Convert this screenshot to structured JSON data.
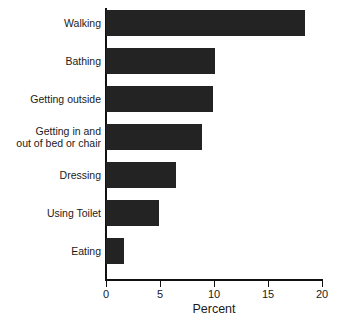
{
  "chart_data": {
    "type": "bar",
    "orientation": "horizontal",
    "title": "",
    "xlabel": "Percent",
    "ylabel": "",
    "categories": [
      "Walking",
      "Bathing",
      "Getting outside",
      "Getting in and\nout of bed or chair",
      "Dressing",
      "Using Toilet",
      "Eating"
    ],
    "values": [
      18.4,
      10.1,
      9.9,
      8.9,
      6.5,
      4.9,
      1.7
    ],
    "xlim": [
      0,
      20
    ],
    "xticks": [
      0,
      5,
      10,
      15,
      20
    ],
    "xtick_labels": [
      "0",
      "5",
      "10",
      "15",
      "20"
    ],
    "grid": false,
    "legend": false,
    "bar_color": "#232323",
    "axis_color": "#111111",
    "text_color": "#1a1a1a",
    "background": "#ffffff"
  }
}
